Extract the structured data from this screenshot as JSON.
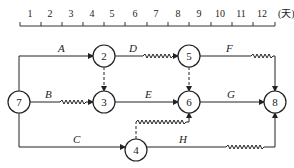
{
  "timeline": {
    "ticks": [
      "1",
      "2",
      "3",
      "4",
      "5",
      "6",
      "7",
      "8",
      "9",
      "10",
      "11",
      "12"
    ],
    "unit": "(天)"
  },
  "nodes": [
    {
      "id": "7",
      "label": "7"
    },
    {
      "id": "2",
      "label": "2"
    },
    {
      "id": "3",
      "label": "3"
    },
    {
      "id": "4",
      "label": "4"
    },
    {
      "id": "5",
      "label": "5"
    },
    {
      "id": "6",
      "label": "6"
    },
    {
      "id": "8",
      "label": "8"
    }
  ],
  "activities": [
    {
      "name": "A",
      "from": "7",
      "to": "2"
    },
    {
      "name": "B",
      "from": "7",
      "to": "3",
      "free_float": true
    },
    {
      "name": "C",
      "from": "7",
      "to": "4"
    },
    {
      "name": "D",
      "from": "2",
      "to": "5",
      "free_float": true
    },
    {
      "name": "E",
      "from": "3",
      "to": "6"
    },
    {
      "name": "F",
      "from": "5",
      "to": "8",
      "free_float": true
    },
    {
      "name": "G",
      "from": "6",
      "to": "8"
    },
    {
      "name": "H",
      "from": "4",
      "to": "8",
      "free_float": true
    }
  ],
  "dummies": [
    {
      "from": "2",
      "to": "3"
    },
    {
      "from": "5",
      "to": "6"
    },
    {
      "from": "4",
      "to": "6",
      "free_float": true
    }
  ]
}
